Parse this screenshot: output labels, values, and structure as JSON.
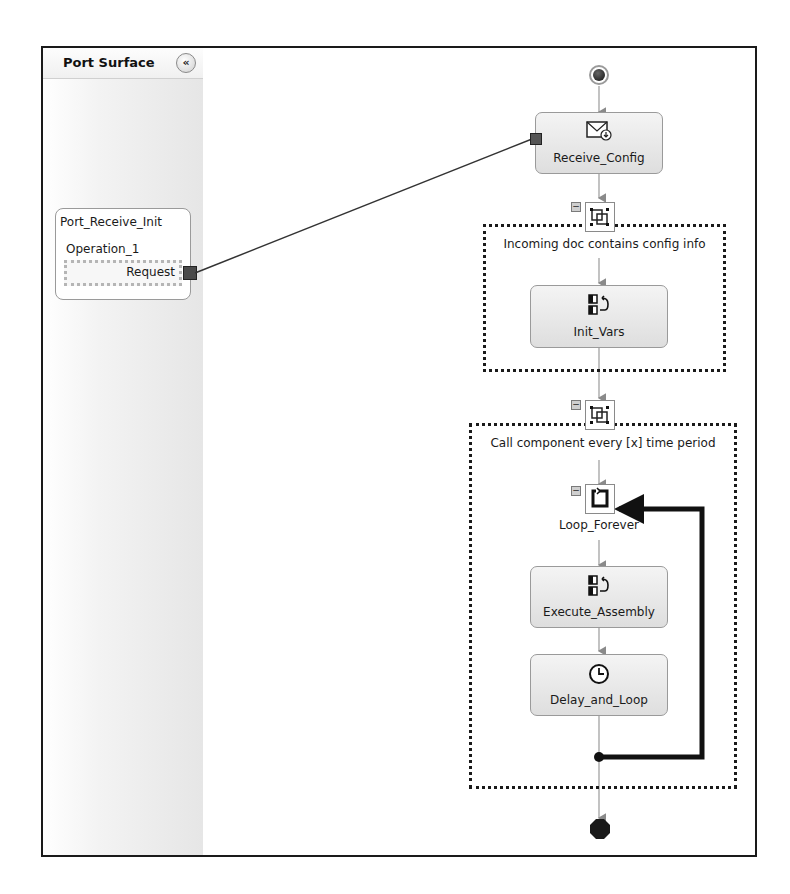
{
  "port_surface": {
    "title": "Port Surface",
    "collapse_icon": "double-chevron-left-icon",
    "ports": [
      {
        "name": "Port_Receive_Init",
        "operation": "Operation_1",
        "message": "Request"
      }
    ]
  },
  "orchestration": {
    "start_shape": "start-icon",
    "shapes": [
      {
        "name": "Receive_Config",
        "type": "receive",
        "icon": "envelope-receive-icon"
      },
      {
        "name": "Init_Vars",
        "type": "expression",
        "icon": "expression-icon",
        "scope": "Incoming doc contains config info"
      },
      {
        "name": "Loop_Forever",
        "type": "loop",
        "icon": "loop-icon",
        "scope": "Call component every [x] time period"
      },
      {
        "name": "Execute_Assembly",
        "type": "expression",
        "icon": "expression-icon"
      },
      {
        "name": "Delay_and_Loop",
        "type": "delay",
        "icon": "clock-icon"
      }
    ],
    "scopes": [
      {
        "label": "Incoming doc contains config info",
        "collapse": "-"
      },
      {
        "label": "Call component every [x] time period",
        "collapse": "-"
      }
    ],
    "loop_collapse": "-",
    "end_shape": "end-icon"
  }
}
